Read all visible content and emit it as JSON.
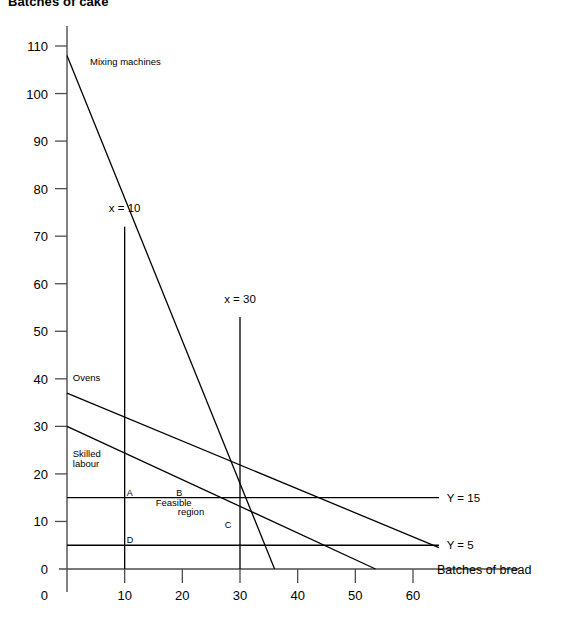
{
  "chart_data": {
    "type": "line",
    "title": "Batches of cake",
    "xlabel": "Batches of bread",
    "ylabel": "Batches of cake",
    "xlim": [
      0,
      65
    ],
    "ylim": [
      0,
      113
    ],
    "grid": false,
    "legend": "inline-labels",
    "x_ticks": [
      0,
      10,
      20,
      30,
      40,
      50,
      60
    ],
    "x_tick_labels": [
      "",
      "10",
      "20",
      "30",
      "40",
      "50",
      "60"
    ],
    "y_ticks": [
      0,
      10,
      20,
      30,
      40,
      50,
      60,
      70,
      80,
      90,
      100,
      110
    ],
    "y_tick_labels": [
      "0",
      "10",
      "20",
      "30",
      "40",
      "50",
      "60",
      "70",
      "80",
      "90",
      "100",
      "110"
    ],
    "origin_label": "0",
    "series": [
      {
        "name": "Mixing machines",
        "label": "Mixing machines",
        "points": [
          [
            0,
            108
          ],
          [
            36,
            0
          ]
        ],
        "label_x": 4,
        "label_y": 106
      },
      {
        "name": "Ovens",
        "label": "Ovens",
        "points": [
          [
            0,
            37
          ],
          [
            64.5,
            4.5
          ]
        ],
        "label_x": 1,
        "label_y": 39.5
      },
      {
        "name": "Skilled labour",
        "label": "Skilled labour",
        "points": [
          [
            0,
            30
          ],
          [
            53.5,
            0
          ]
        ],
        "label_x": 1,
        "label_y": 23.5
      },
      {
        "name": "x = 10",
        "label": "x = 10",
        "points": [
          [
            10,
            72
          ],
          [
            10,
            0
          ]
        ],
        "label_x": 10,
        "label_y": 75
      },
      {
        "name": "x = 30",
        "label": "x = 30",
        "points": [
          [
            30,
            53
          ],
          [
            30,
            0
          ]
        ],
        "label_x": 30,
        "label_y": 56
      },
      {
        "name": "Y = 15",
        "label": "Y = 15",
        "points": [
          [
            0,
            15
          ],
          [
            64.5,
            15
          ]
        ],
        "label_x": 66,
        "label_y": 15
      },
      {
        "name": "Y = 5",
        "label": "Y = 5",
        "points": [
          [
            0,
            5
          ],
          [
            64.5,
            5
          ]
        ],
        "label_x": 66,
        "label_y": 5
      }
    ],
    "annotations": [
      {
        "name": "feasible-region",
        "text": "Feasible",
        "x": 18.5,
        "y": 13.3
      },
      {
        "name": "feasible-region-2",
        "text": "region",
        "x": 21.5,
        "y": 11.3
      }
    ],
    "vertices": [
      {
        "name": "A",
        "label": "A",
        "x": 10,
        "y": 15
      },
      {
        "name": "B",
        "label": "B",
        "x": 18.6,
        "y": 15
      },
      {
        "name": "C",
        "label": "C",
        "x": 27,
        "y": 8.2
      },
      {
        "name": "D",
        "label": "D",
        "x": 10,
        "y": 5
      }
    ]
  }
}
